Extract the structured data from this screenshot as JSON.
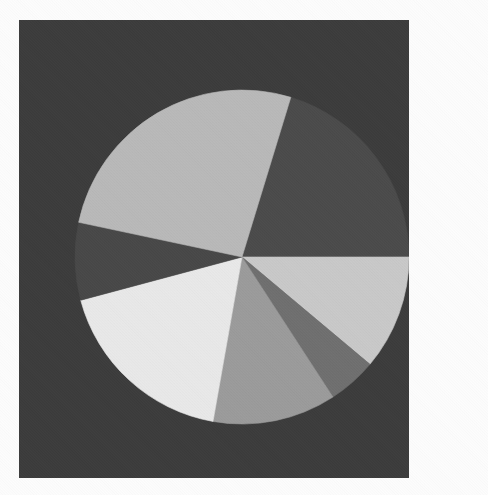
{
  "figure": {
    "background_color": "#3b3b3b",
    "page_color": "#fdfdfd",
    "panel": {
      "x": 19,
      "y": 20,
      "width": 390,
      "height": 458
    },
    "title": "",
    "caption": ""
  },
  "chart_data": {
    "type": "pie",
    "title": "",
    "subtitle": "",
    "xlabel": "",
    "ylabel": "",
    "grid": false,
    "legend": "none",
    "start_angle_deg_from_3oclock": -73,
    "direction": "clockwise",
    "center": {
      "cx": 223,
      "cy": 237
    },
    "radius": 167,
    "total": 100,
    "labels": [
      "Slice 1",
      "Slice 2",
      "Slice 3",
      "Slice 4",
      "Slice 5",
      "Slice 6",
      "Slice 7"
    ],
    "values": [
      20.3,
      11.1,
      4.7,
      11.9,
      18.1,
      7.5,
      26.4
    ],
    "angles_deg": [
      73,
      40,
      17,
      43,
      65,
      27,
      95
    ],
    "colors": [
      "#4a4a4a",
      "#c9c9c9",
      "#6f6f6f",
      "#9b9b9b",
      "#e9e9e9",
      "#474747",
      "#b9b9b9"
    ],
    "slices": [
      {
        "label": "Slice 1",
        "value": 20.3,
        "angle_deg": 73,
        "start_deg": -73,
        "end_deg": 0,
        "color": "#4a4a4a",
        "description": "dark-gray upper-right wedge"
      },
      {
        "label": "Slice 2",
        "value": 11.1,
        "angle_deg": 40,
        "start_deg": 0,
        "end_deg": 40,
        "color": "#c9c9c9",
        "description": "light-gray right wedge below horizontal"
      },
      {
        "label": "Slice 3",
        "value": 4.7,
        "angle_deg": 17,
        "start_deg": 40,
        "end_deg": 57,
        "color": "#6f6f6f",
        "description": "narrow mid-dark wedge lower-right"
      },
      {
        "label": "Slice 4",
        "value": 11.9,
        "angle_deg": 43,
        "start_deg": 57,
        "end_deg": 100,
        "color": "#9b9b9b",
        "description": "medium-gray bottom wedge"
      },
      {
        "label": "Slice 5",
        "value": 18.1,
        "angle_deg": 65,
        "start_deg": 100,
        "end_deg": 165,
        "color": "#e9e9e9",
        "description": "near-white lower-left wedge"
      },
      {
        "label": "Slice 6",
        "value": 7.5,
        "angle_deg": 27,
        "start_deg": 165,
        "end_deg": 192,
        "color": "#474747",
        "description": "dark wedge at left"
      },
      {
        "label": "Slice 7",
        "value": 26.4,
        "angle_deg": 95,
        "start_deg": 192,
        "end_deg": 287,
        "color": "#b9b9b9",
        "description": "light-gray upper-left wedge"
      }
    ]
  }
}
